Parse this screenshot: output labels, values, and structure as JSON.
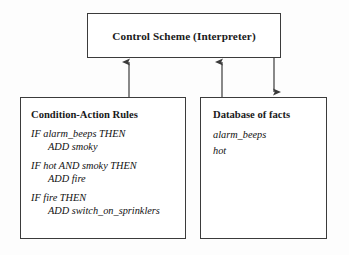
{
  "diagram": {
    "control": {
      "title": "Control Scheme (Interpreter)"
    },
    "rules_panel": {
      "title": "Condition-Action Rules",
      "rules": [
        {
          "condition": "IF alarm_beeps THEN",
          "action": "ADD smoky"
        },
        {
          "condition": "IF hot AND smoky THEN",
          "action": "ADD fire"
        },
        {
          "condition": "IF fire THEN",
          "action": "ADD switch_on_sprinklers"
        }
      ]
    },
    "facts_panel": {
      "title": "Database of facts",
      "facts": [
        "alarm_beeps",
        "hot"
      ]
    },
    "connectors": [
      {
        "name": "rules-to-control",
        "direction": "up"
      },
      {
        "name": "facts-to-control",
        "direction": "up"
      },
      {
        "name": "control-to-facts",
        "direction": "down"
      }
    ],
    "colors": {
      "border": "#3b3b3b",
      "text": "#111111",
      "background": "#fdfdfd"
    }
  }
}
